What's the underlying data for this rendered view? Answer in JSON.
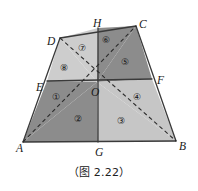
{
  "figure": {
    "caption": "（图 2.22）",
    "outline_color": "#3a3a3a",
    "dashed_color": "#2b2b2b",
    "background": "#ffffff",
    "vertices": [
      {
        "name": "A",
        "label": "A",
        "x": 23,
        "y": 142,
        "lx": 16,
        "ly": 143
      },
      {
        "name": "B",
        "label": "B",
        "x": 176,
        "y": 141,
        "lx": 179,
        "ly": 141
      },
      {
        "name": "C",
        "label": "C",
        "x": 136,
        "y": 26,
        "lx": 139,
        "ly": 19
      },
      {
        "name": "D",
        "label": "D",
        "x": 60,
        "y": 38,
        "lx": 47,
        "ly": 36
      },
      {
        "name": "E",
        "label": "E",
        "x": 47,
        "y": 81,
        "lx": 36,
        "ly": 82
      },
      {
        "name": "F",
        "label": "F",
        "x": 152,
        "y": 79,
        "lx": 157,
        "ly": 75
      },
      {
        "name": "G",
        "label": "G",
        "x": 98,
        "y": 142,
        "lx": 95,
        "ly": 147
      },
      {
        "name": "H",
        "label": "H",
        "x": 98,
        "y": 28,
        "lx": 93,
        "ly": 18
      },
      {
        "name": "O",
        "label": "O",
        "x": 97,
        "y": 82,
        "lx": 91,
        "ly": 87
      }
    ],
    "regions": [
      {
        "name": "region-1",
        "label": "①",
        "x": 52,
        "y": 93,
        "fill": "#8f8f8f"
      },
      {
        "name": "region-2",
        "label": "②",
        "x": 74,
        "y": 115,
        "fill": "#8f8f8f"
      },
      {
        "name": "region-3",
        "label": "③",
        "x": 117,
        "y": 117,
        "fill": "#c8c8c8"
      },
      {
        "name": "region-4",
        "label": "④",
        "x": 133,
        "y": 93,
        "fill": "#c8c8c8"
      },
      {
        "name": "region-5",
        "label": "⑤",
        "x": 121,
        "y": 58,
        "fill": "#8f8f8f"
      },
      {
        "name": "region-6",
        "label": "⑥",
        "x": 102,
        "y": 36,
        "fill": "#8f8f8f"
      },
      {
        "name": "region-7",
        "label": "⑦",
        "x": 78,
        "y": 44,
        "fill": "#cfcfcf"
      },
      {
        "name": "region-8",
        "label": "⑧",
        "x": 60,
        "y": 64,
        "fill": "#cfcfcf"
      }
    ],
    "polygons": [
      {
        "name": "quad-region-8-DEO",
        "points": "60,38 47,81 97,82",
        "fill": "#cdcdcd"
      },
      {
        "name": "quad-region-7-DHO",
        "points": "60,38 98,28 97,82",
        "fill": "#cdcdcd"
      },
      {
        "name": "quad-region-6-HCO",
        "points": "98,28 136,26 97,82",
        "fill": "#8c8c8c"
      },
      {
        "name": "quad-region-5-CFO",
        "points": "136,26 152,79 97,82",
        "fill": "#8c8c8c"
      },
      {
        "name": "quad-region-4-FBO",
        "points": "152,79 176,141 97,82",
        "fill": "#c6c6c6"
      },
      {
        "name": "quad-region-3-BGO",
        "points": "176,141 98,142 97,82",
        "fill": "#c6c6c6"
      },
      {
        "name": "quad-region-2-GAO",
        "points": "98,142 23,142 97,82",
        "fill": "#8c8c8c"
      },
      {
        "name": "quad-region-1-AEO",
        "points": "23,142 47,81 97,82",
        "fill": "#8c8c8c"
      }
    ],
    "solid_lines": [
      {
        "name": "edge-AD",
        "x1": 23,
        "y1": 142,
        "x2": 60,
        "y2": 38
      },
      {
        "name": "edge-DC",
        "x1": 60,
        "y1": 38,
        "x2": 136,
        "y2": 26
      },
      {
        "name": "edge-CB",
        "x1": 136,
        "y1": 26,
        "x2": 176,
        "y2": 141
      },
      {
        "name": "edge-BA",
        "x1": 176,
        "y1": 141,
        "x2": 23,
        "y2": 142
      },
      {
        "name": "edge-EF",
        "x1": 47,
        "y1": 81,
        "x2": 152,
        "y2": 79
      },
      {
        "name": "edge-HG",
        "x1": 98,
        "y1": 28,
        "x2": 98,
        "y2": 142
      }
    ],
    "dashed_lines": [
      {
        "name": "diagonal-AC",
        "x1": 23,
        "y1": 142,
        "x2": 136,
        "y2": 26
      },
      {
        "name": "diagonal-DB",
        "x1": 60,
        "y1": 38,
        "x2": 176,
        "y2": 141
      }
    ]
  }
}
